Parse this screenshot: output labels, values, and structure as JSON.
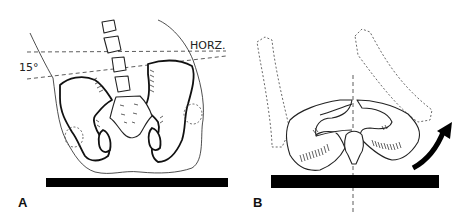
{
  "figure": {
    "panels": [
      {
        "id": "A",
        "label": "A",
        "annotations": {
          "horizontal_label": "HORZ.",
          "angle_label": "15°"
        },
        "description": "Frontal view of pelvis and lumbar spine on table, pelvic tilt of 15 degrees relative to horizontal"
      },
      {
        "id": "B",
        "label": "B",
        "description": "Axial view of pelvis on table with femurs (dashed) and curved arrow indicating rotation"
      }
    ],
    "colors": {
      "ink": "#111111",
      "background": "#ffffff"
    }
  }
}
